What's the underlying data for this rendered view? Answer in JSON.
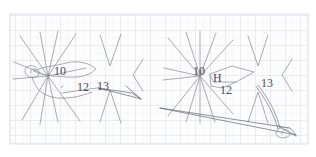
{
  "document": {
    "kind": "pencil-sketch-on-graph-paper",
    "title": "",
    "background_color": "#ffffff",
    "paper_color": "#fdfdfe",
    "grid": {
      "minor_color": "#e9ecf2",
      "major_color": "#d7dce6",
      "minor_spacing_px": 7.5,
      "major_every": 2,
      "left": 10,
      "top": 14,
      "width": 298,
      "height": 130
    },
    "ink_color": "#8a8a93",
    "ink_color_dark": "#5a5a63"
  },
  "figures": [
    {
      "id": "left-figure",
      "name": "left-sketch",
      "center": [
        48,
        76
      ],
      "labels": [
        {
          "name": "label-10",
          "text": "10",
          "x": 54,
          "y": 72
        },
        {
          "name": "label-12",
          "text": "12",
          "x": 77,
          "y": 88
        },
        {
          "name": "label-13",
          "text": "13",
          "x": 97,
          "y": 87
        }
      ],
      "elements": [
        "radial-starburst",
        "chevron-pair",
        "closed-loop-outline",
        "spiral-coil",
        "tapered-wedge"
      ]
    },
    {
      "id": "right-figure",
      "name": "right-sketch",
      "center": [
        200,
        76
      ],
      "labels": [
        {
          "name": "label-10",
          "text": "10",
          "x": 196,
          "y": 72
        },
        {
          "name": "label-H",
          "text": "H",
          "x": 214,
          "y": 79
        },
        {
          "name": "label-12",
          "text": "12",
          "x": 222,
          "y": 91
        },
        {
          "name": "label-13",
          "text": "13",
          "x": 263,
          "y": 84
        }
      ],
      "elements": [
        "radial-starburst",
        "chevron-pair",
        "diamond-outline",
        "long-tapered-wedge",
        "spiral-coil"
      ]
    }
  ]
}
